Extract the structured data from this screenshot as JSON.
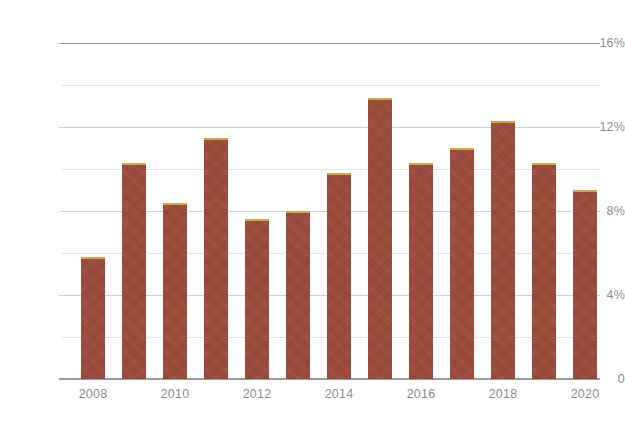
{
  "chart_data": {
    "type": "bar",
    "title": "",
    "subtitle": "",
    "xlabel": "",
    "ylabel": "",
    "categories": [
      "2008",
      "2009",
      "2010",
      "2011",
      "2012",
      "2013",
      "2014",
      "2015",
      "2016",
      "2017",
      "2018",
      "2019",
      "2020"
    ],
    "values": [
      5.8,
      10.3,
      8.4,
      11.5,
      7.6,
      8.0,
      9.8,
      13.4,
      10.3,
      11.0,
      12.3,
      10.3,
      9.0
    ],
    "value_unit": "%",
    "ylim": [
      0,
      16
    ],
    "y_major_ticks": [
      0,
      4,
      8,
      12,
      16
    ],
    "y_major_tick_labels": [
      "0",
      "4%",
      "8%",
      "12%",
      "16%"
    ],
    "y_minor_ticks": [
      2,
      6,
      10,
      14
    ],
    "x_tick_labels": [
      "2008",
      "2010",
      "2012",
      "2014",
      "2016",
      "2018",
      "2020"
    ],
    "x_tick_categories": [
      "2008",
      "2010",
      "2012",
      "2014",
      "2016",
      "2018",
      "2020"
    ],
    "grid": true,
    "grid_axis": "y",
    "legend": false,
    "legend_position": "none",
    "series": [
      {
        "name": "",
        "values": [
          5.8,
          10.3,
          8.4,
          11.5,
          7.6,
          8.0,
          9.8,
          13.4,
          10.3,
          11.0,
          12.3,
          10.3,
          9.0
        ],
        "bar_color": "#9e4a38",
        "bar_top_color": "#d9a53c"
      }
    ]
  },
  "colors": {
    "background": "#ffffff",
    "bar_fill": "#9e4a38",
    "bar_top_edge": "#d9a53c",
    "axis_line": "#9a9a9a",
    "gridline_major": "#cfcfcf",
    "gridline_minor": "#e2e2e2",
    "tick_label": "#8d8d8d"
  }
}
